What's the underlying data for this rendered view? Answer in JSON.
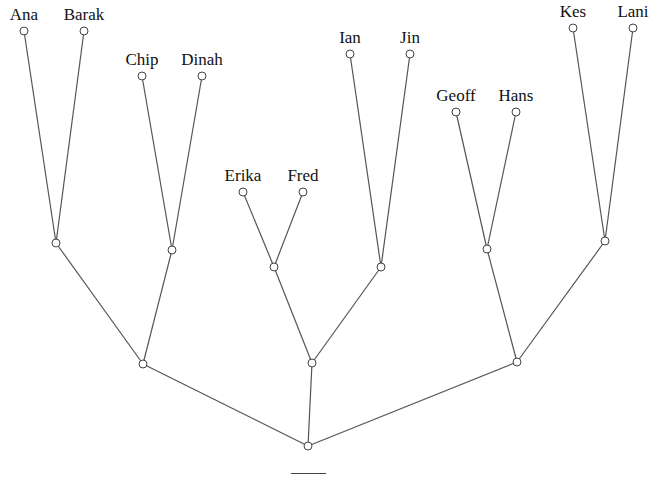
{
  "diagram": {
    "type": "phylogenetic-tree",
    "colors": {
      "edge": "#555555",
      "node_stroke": "#444444",
      "node_fill": "#ffffff",
      "text": "#111111"
    },
    "leaves": [
      {
        "id": "ana",
        "label": "Ana",
        "x": 24,
        "y": 31
      },
      {
        "id": "barak",
        "label": "Barak",
        "x": 84,
        "y": 31
      },
      {
        "id": "chip",
        "label": "Chip",
        "x": 142,
        "y": 76
      },
      {
        "id": "dinah",
        "label": "Dinah",
        "x": 202,
        "y": 76
      },
      {
        "id": "erika",
        "label": "Erika",
        "x": 243,
        "y": 192
      },
      {
        "id": "fred",
        "label": "Fred",
        "x": 303,
        "y": 192
      },
      {
        "id": "ian",
        "label": "Ian",
        "x": 350,
        "y": 54
      },
      {
        "id": "jin",
        "label": "Jin",
        "x": 410,
        "y": 54
      },
      {
        "id": "geoff",
        "label": "Geoff",
        "x": 456,
        "y": 112
      },
      {
        "id": "hans",
        "label": "Hans",
        "x": 516,
        "y": 112
      },
      {
        "id": "kes",
        "label": "Kes",
        "x": 573,
        "y": 28
      },
      {
        "id": "lani",
        "label": "Lani",
        "x": 633,
        "y": 28
      }
    ],
    "internal": [
      {
        "id": "ab",
        "x": 56,
        "y": 243
      },
      {
        "id": "cd",
        "x": 172,
        "y": 250
      },
      {
        "id": "ef",
        "x": 274,
        "y": 267
      },
      {
        "id": "ij",
        "x": 381,
        "y": 267
      },
      {
        "id": "gh",
        "x": 487,
        "y": 249
      },
      {
        "id": "kl",
        "x": 605,
        "y": 241
      },
      {
        "id": "abcd",
        "x": 143,
        "y": 364
      },
      {
        "id": "efij",
        "x": 312,
        "y": 363
      },
      {
        "id": "ghkl",
        "x": 517,
        "y": 362
      },
      {
        "id": "root",
        "x": 308,
        "y": 446
      }
    ],
    "edges": [
      [
        "ana",
        "ab"
      ],
      [
        "barak",
        "ab"
      ],
      [
        "chip",
        "cd"
      ],
      [
        "dinah",
        "cd"
      ],
      [
        "erika",
        "ef"
      ],
      [
        "fred",
        "ef"
      ],
      [
        "ian",
        "ij"
      ],
      [
        "jin",
        "ij"
      ],
      [
        "geoff",
        "gh"
      ],
      [
        "hans",
        "gh"
      ],
      [
        "kes",
        "kl"
      ],
      [
        "lani",
        "kl"
      ],
      [
        "ab",
        "abcd"
      ],
      [
        "cd",
        "abcd"
      ],
      [
        "ef",
        "efij"
      ],
      [
        "ij",
        "efij"
      ],
      [
        "gh",
        "ghkl"
      ],
      [
        "kl",
        "ghkl"
      ],
      [
        "abcd",
        "root"
      ],
      [
        "efij",
        "root"
      ],
      [
        "ghkl",
        "root"
      ]
    ],
    "scale_bar": {
      "x1": 291,
      "x2": 326,
      "y": 473
    }
  }
}
